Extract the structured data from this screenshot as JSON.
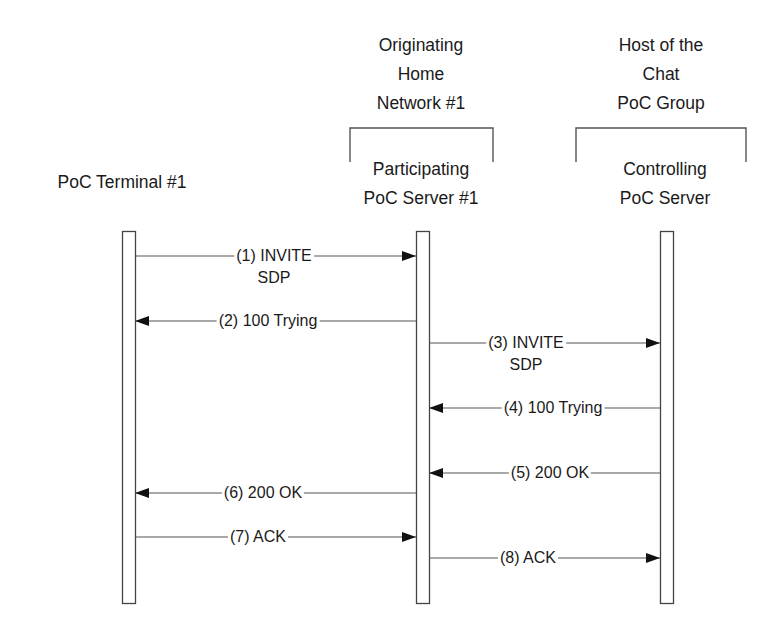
{
  "diagram": {
    "type": "sequence",
    "groups": [
      {
        "id": "originating_home_network",
        "label_lines": [
          "Originating",
          "Home",
          "Network #1"
        ],
        "bracket": {
          "x1": 350,
          "x2": 493,
          "top": 128,
          "bottom": 162
        },
        "label_center_x": 421,
        "label_top": 31
      },
      {
        "id": "host_of_chat_group",
        "label_lines": [
          "Host of the",
          "Chat",
          "PoC Group"
        ],
        "bracket": {
          "x1": 576,
          "x2": 746,
          "top": 128,
          "bottom": 162
        },
        "label_center_x": 661,
        "label_top": 31
      }
    ],
    "participants": [
      {
        "id": "terminal",
        "label_lines": [
          "PoC Terminal #1"
        ],
        "center_x": 128,
        "label_center_x": 122,
        "label_top": 168,
        "lifeline": {
          "x": 122,
          "width": 13,
          "top": 231,
          "bottom": 603
        }
      },
      {
        "id": "participating",
        "label_lines": [
          "Participating",
          "PoC Server #1"
        ],
        "center_x": 422,
        "label_center_x": 421,
        "label_top": 155,
        "lifeline": {
          "x": 416,
          "width": 13,
          "top": 231,
          "bottom": 603
        }
      },
      {
        "id": "controlling",
        "label_lines": [
          "Controlling",
          "PoC Server"
        ],
        "center_x": 666,
        "label_center_x": 665,
        "label_top": 155,
        "lifeline": {
          "x": 660,
          "width": 13,
          "top": 231,
          "bottom": 603
        }
      }
    ],
    "messages": [
      {
        "step": 1,
        "label_lines": [
          "(1) INVITE",
          "SDP"
        ],
        "from": "terminal",
        "to": "participating",
        "y": 256,
        "x1": 135,
        "x2": 416,
        "label_x": 274
      },
      {
        "step": 2,
        "label_lines": [
          "(2) 100 Trying"
        ],
        "from": "participating",
        "to": "terminal",
        "y": 321,
        "x1": 416,
        "x2": 135,
        "label_x": 268
      },
      {
        "step": 3,
        "label_lines": [
          "(3) INVITE",
          "SDP"
        ],
        "from": "participating",
        "to": "controlling",
        "y": 343,
        "x1": 429,
        "x2": 660,
        "label_x": 526
      },
      {
        "step": 4,
        "label_lines": [
          "(4) 100 Trying"
        ],
        "from": "controlling",
        "to": "participating",
        "y": 408,
        "x1": 660,
        "x2": 429,
        "label_x": 553
      },
      {
        "step": 5,
        "label_lines": [
          "(5) 200 OK"
        ],
        "from": "controlling",
        "to": "participating",
        "y": 473,
        "x1": 660,
        "x2": 429,
        "label_x": 550
      },
      {
        "step": 6,
        "label_lines": [
          "(6) 200 OK"
        ],
        "from": "participating",
        "to": "terminal",
        "y": 493,
        "x1": 416,
        "x2": 135,
        "label_x": 263
      },
      {
        "step": 7,
        "label_lines": [
          "(7) ACK"
        ],
        "from": "terminal",
        "to": "participating",
        "y": 537,
        "x1": 135,
        "x2": 416,
        "label_x": 258
      },
      {
        "step": 8,
        "label_lines": [
          "(8) ACK"
        ],
        "from": "participating",
        "to": "controlling",
        "y": 558,
        "x1": 429,
        "x2": 660,
        "label_x": 528
      }
    ]
  },
  "colors": {
    "line": "#555555",
    "lifeline_stroke": "#444444",
    "arrowhead": "#111111",
    "text": "#1a1a1a",
    "background": "#ffffff"
  }
}
